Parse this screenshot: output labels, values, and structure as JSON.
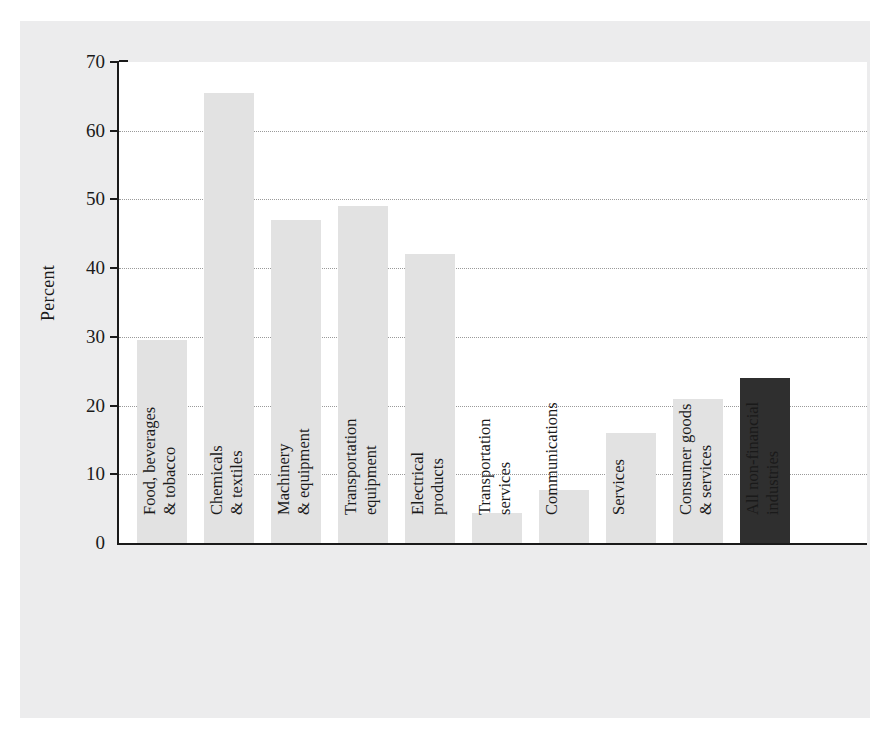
{
  "title_faint": "",
  "axes": {
    "ylabel": "Percent",
    "yticks": [
      0,
      10,
      20,
      30,
      40,
      50,
      60,
      70
    ],
    "ymin": 0,
    "ymax": 70
  },
  "colors": {
    "figure_background": "#ececed",
    "plot_background": "#ffffff",
    "bar": "#e2e2e2",
    "bar_highlight": "#2f2f2f",
    "axis": "#1a1a1a",
    "gridline": "#9a9a9a"
  },
  "chart_data": {
    "type": "bar",
    "title": "",
    "xlabel": "",
    "ylabel": "Percent",
    "ylim": [
      0,
      70
    ],
    "grid": true,
    "legend": null,
    "categories": [
      "Food, beverages & tobacco",
      "Chemicals & textiles",
      "Machinery & equipment",
      "Transportation equipment",
      "Electrical products",
      "Transportation services",
      "Communications",
      "Services",
      "Consumer goods & services",
      "All non-financial industries"
    ],
    "category_lines": [
      [
        "Food, beverages",
        "& tobacco"
      ],
      [
        "Chemicals",
        "& textiles"
      ],
      [
        "Machinery",
        "& equipment"
      ],
      [
        "Transportation",
        "equipment"
      ],
      [
        "Electrical",
        "products"
      ],
      [
        "Transportation",
        "services"
      ],
      [
        "Communications",
        ""
      ],
      [
        "Services",
        ""
      ],
      [
        "Consumer goods",
        "& services"
      ],
      [
        "All non-financial",
        "industries"
      ]
    ],
    "values": [
      29.5,
      65.5,
      47.0,
      49.0,
      42.0,
      4.4,
      7.7,
      16.0,
      21.0,
      24.0
    ],
    "highlight_index": 9
  }
}
